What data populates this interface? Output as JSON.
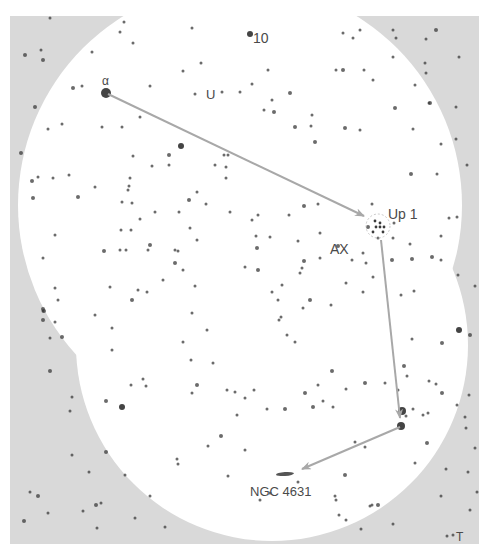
{
  "map": {
    "title": "Finder chart: Alpha to Up 1 to NGC 4631",
    "colors": {
      "page": "#ffffff",
      "sky_outside": "#d9d9d9",
      "sky_inside": "#ffffff",
      "star": "#3a3a3a",
      "arrow": "#a8a8a8",
      "label": "#4a4a4a"
    },
    "frame": {
      "x": 10,
      "y": 16,
      "width": 469,
      "height": 528
    },
    "fields_of_view": [
      {
        "cx": 240,
        "cy": 205,
        "r": 222
      },
      {
        "cx": 272,
        "cy": 345,
        "r": 196
      }
    ],
    "labels": [
      {
        "id": "alpha",
        "text": "α",
        "x": 102,
        "y": 85,
        "size": 12
      },
      {
        "id": "ten",
        "text": "10",
        "x": 253,
        "y": 43,
        "size": 14
      },
      {
        "id": "u",
        "text": "U",
        "x": 206,
        "y": 99,
        "size": 13
      },
      {
        "id": "up1",
        "text": "Up 1",
        "x": 388,
        "y": 219,
        "size": 14
      },
      {
        "id": "ax",
        "text": "AX",
        "x": 330,
        "y": 254,
        "size": 14
      },
      {
        "id": "ngc4631",
        "text": "NGC 4631",
        "x": 250,
        "y": 496,
        "size": 13
      },
      {
        "id": "t",
        "text": "T",
        "x": 456,
        "y": 541,
        "size": 12
      }
    ],
    "route": [
      {
        "from": "α",
        "to": "Up 1",
        "x1": 108,
        "y1": 94,
        "x2": 364,
        "y2": 216
      },
      {
        "from": "Up 1",
        "to": "star near 4631",
        "x1": 381,
        "y1": 240,
        "x2": 400,
        "y2": 418
      },
      {
        "from": "star near 4631",
        "to": "NGC 4631",
        "x1": 400,
        "y1": 427,
        "x2": 302,
        "y2": 469
      }
    ],
    "galaxy": {
      "name": "NGC 4631",
      "cx": 285,
      "cy": 474,
      "rx": 9,
      "ry": 2
    },
    "cluster": {
      "name": "Up 1",
      "cx": 378,
      "cy": 226,
      "r": 12
    },
    "stars": [
      [
        106,
        93,
        5
      ],
      [
        250,
        34,
        3
      ],
      [
        222,
        92,
        1.5
      ],
      [
        240,
        92,
        1.5
      ],
      [
        252,
        84,
        1.5
      ],
      [
        268,
        70,
        1.5
      ],
      [
        272,
        100,
        1.5
      ],
      [
        290,
        93,
        2
      ],
      [
        264,
        110,
        1.5
      ],
      [
        274,
        112,
        2
      ],
      [
        295,
        127,
        2
      ],
      [
        311,
        126,
        1.5
      ],
      [
        315,
        142,
        2
      ],
      [
        50,
        18,
        1.5
      ],
      [
        124,
        22,
        1.5
      ],
      [
        120,
        32,
        1.5
      ],
      [
        25,
        55,
        2
      ],
      [
        41,
        50,
        1.5
      ],
      [
        43,
        60,
        2
      ],
      [
        92,
        52,
        1.5
      ],
      [
        133,
        43,
        1.5
      ],
      [
        150,
        86,
        1.5
      ],
      [
        35,
        107,
        2
      ],
      [
        73,
        88,
        2
      ],
      [
        82,
        86,
        1.5
      ],
      [
        140,
        117,
        1.5
      ],
      [
        122,
        127,
        1.5
      ],
      [
        48,
        129,
        1.5
      ],
      [
        62,
        124,
        1.5
      ],
      [
        102,
        127,
        1.5
      ],
      [
        181,
        146,
        3
      ],
      [
        169,
        155,
        2
      ],
      [
        152,
        166,
        1.5
      ],
      [
        21,
        153,
        2
      ],
      [
        38,
        177,
        1.5
      ],
      [
        53,
        178,
        1.5
      ],
      [
        69,
        175,
        1.5
      ],
      [
        130,
        178,
        1.5
      ],
      [
        215,
        165,
        1.5
      ],
      [
        224,
        155,
        1.5
      ],
      [
        192,
        28,
        1.5
      ],
      [
        201,
        63,
        1.5
      ],
      [
        195,
        94,
        1.5
      ],
      [
        183,
        71,
        1.5
      ],
      [
        169,
        165,
        1.5
      ],
      [
        343,
        33,
        1.5
      ],
      [
        360,
        30,
        1.5
      ],
      [
        353,
        38,
        1.5
      ],
      [
        393,
        30,
        1.5
      ],
      [
        396,
        38,
        1.5
      ],
      [
        436,
        30,
        2
      ],
      [
        426,
        39,
        1.5
      ],
      [
        459,
        57,
        1.5
      ],
      [
        393,
        57,
        1.5
      ],
      [
        425,
        63,
        1.5
      ],
      [
        426,
        73,
        1.5
      ],
      [
        415,
        85,
        1.5
      ],
      [
        430,
        103,
        2
      ],
      [
        456,
        107,
        1.5
      ],
      [
        395,
        108,
        2
      ],
      [
        429,
        103,
        1.5
      ],
      [
        413,
        129,
        1.5
      ],
      [
        456,
        139,
        1.5
      ],
      [
        441,
        144,
        1.5
      ],
      [
        467,
        165,
        1.5
      ],
      [
        437,
        174,
        1.5
      ],
      [
        411,
        174,
        2
      ],
      [
        449,
        218,
        1.5
      ],
      [
        457,
        217,
        1.5
      ],
      [
        441,
        236,
        1.5
      ],
      [
        343,
        70,
        2
      ],
      [
        336,
        70,
        1.5
      ],
      [
        364,
        70,
        1.5
      ],
      [
        373,
        80,
        1.5
      ],
      [
        312,
        115,
        1.5
      ],
      [
        360,
        130,
        1.5
      ],
      [
        345,
        128,
        2
      ],
      [
        133,
        156,
        1.5
      ],
      [
        129,
        186,
        1.5
      ],
      [
        189,
        200,
        2
      ],
      [
        121,
        230,
        1.5
      ],
      [
        131,
        230,
        1.5
      ],
      [
        132,
        203,
        1.5
      ],
      [
        140,
        219,
        1.5
      ],
      [
        155,
        212,
        1.5
      ],
      [
        179,
        212,
        1.5
      ],
      [
        197,
        192,
        1.5
      ],
      [
        206,
        204,
        1.5
      ],
      [
        230,
        212,
        1.5
      ],
      [
        252,
        220,
        1.5
      ],
      [
        258,
        215,
        1.5
      ],
      [
        256,
        236,
        1.5
      ],
      [
        270,
        237,
        1.5
      ],
      [
        257,
        248,
        2
      ],
      [
        289,
        215,
        1.5
      ],
      [
        298,
        241,
        1.5
      ],
      [
        304,
        261,
        2
      ],
      [
        302,
        268,
        1.5
      ],
      [
        258,
        270,
        2
      ],
      [
        150,
        245,
        2
      ],
      [
        245,
        267,
        1.5
      ],
      [
        175,
        250,
        1.5
      ],
      [
        228,
        155,
        1.5
      ],
      [
        226,
        167,
        1.5
      ],
      [
        226,
        178,
        1.5
      ],
      [
        32,
        181,
        2
      ],
      [
        33,
        198,
        2
      ],
      [
        78,
        197,
        2
      ],
      [
        95,
        187,
        1.5
      ],
      [
        128,
        190,
        1.5
      ],
      [
        122,
        202,
        1.5
      ],
      [
        55,
        235,
        1.5
      ],
      [
        43,
        258,
        1.5
      ],
      [
        104,
        251,
        2
      ],
      [
        120,
        250,
        1.5
      ],
      [
        126,
        250,
        1.5
      ],
      [
        148,
        250,
        1.5
      ],
      [
        175,
        263,
        2
      ],
      [
        178,
        251,
        1.5
      ],
      [
        197,
        240,
        1.5
      ],
      [
        190,
        228,
        1.5
      ],
      [
        112,
        328,
        1.5
      ],
      [
        95,
        315,
        1.5
      ],
      [
        55,
        322,
        1.5
      ],
      [
        43,
        311,
        1.5
      ],
      [
        43,
        309,
        2
      ],
      [
        55,
        288,
        1.5
      ],
      [
        58,
        300,
        1.5
      ],
      [
        110,
        287,
        1.5
      ],
      [
        138,
        290,
        1.5
      ],
      [
        147,
        292,
        1.5
      ],
      [
        195,
        286,
        1.5
      ],
      [
        183,
        270,
        1.5
      ],
      [
        163,
        280,
        1.5
      ],
      [
        132,
        300,
        2
      ],
      [
        112,
        350,
        1.5
      ],
      [
        44,
        311,
        2
      ],
      [
        43,
        320,
        2
      ],
      [
        50,
        338,
        1.5
      ],
      [
        62,
        337,
        2
      ],
      [
        50,
        371,
        2
      ],
      [
        72,
        397,
        1.5
      ],
      [
        70,
        411,
        1.5
      ],
      [
        106,
        401,
        2
      ],
      [
        72,
        455,
        1.5
      ],
      [
        106,
        452,
        2
      ],
      [
        89,
        472,
        1.5
      ],
      [
        125,
        475,
        1.5
      ],
      [
        131,
        385,
        1.5
      ],
      [
        143,
        379,
        1.5
      ],
      [
        146,
        386,
        1.5
      ],
      [
        192,
        393,
        1.5
      ],
      [
        122,
        407,
        3
      ],
      [
        30,
        492,
        1.5
      ],
      [
        38,
        496,
        2
      ],
      [
        24,
        521,
        2
      ],
      [
        48,
        513,
        1.5
      ],
      [
        96,
        505,
        2
      ],
      [
        101,
        503,
        1.5
      ],
      [
        83,
        511,
        1.5
      ],
      [
        97,
        528,
        1.5
      ],
      [
        135,
        518,
        1.5
      ],
      [
        150,
        496,
        1.5
      ],
      [
        165,
        527,
        1.5
      ],
      [
        192,
        313,
        1.5
      ],
      [
        207,
        330,
        1.5
      ],
      [
        191,
        360,
        1.5
      ],
      [
        183,
        342,
        1.5
      ],
      [
        213,
        363,
        1.5
      ],
      [
        197,
        385,
        2
      ],
      [
        254,
        390,
        1.5
      ],
      [
        235,
        392,
        1.5
      ],
      [
        227,
        390,
        1.5
      ],
      [
        245,
        398,
        1.5
      ],
      [
        237,
        415,
        1.5
      ],
      [
        267,
        409,
        1.5
      ],
      [
        221,
        436,
        2
      ],
      [
        208,
        446,
        1.5
      ],
      [
        178,
        464,
        1.5
      ],
      [
        177,
        459,
        1.5
      ],
      [
        228,
        476,
        1.5
      ],
      [
        245,
        450,
        1.5
      ],
      [
        285,
        409,
        2
      ],
      [
        305,
        393,
        2
      ],
      [
        313,
        407,
        2
      ],
      [
        323,
        401,
        1.5
      ],
      [
        333,
        407,
        1.5
      ],
      [
        298,
        482,
        1.5
      ],
      [
        335,
        496,
        1.5
      ],
      [
        339,
        515,
        1.5
      ],
      [
        270,
        493,
        1.5
      ],
      [
        260,
        500,
        1.5
      ],
      [
        281,
        317,
        1.5
      ],
      [
        287,
        335,
        1.5
      ],
      [
        295,
        342,
        1.5
      ],
      [
        318,
        385,
        1.5
      ],
      [
        332,
        371,
        2
      ],
      [
        346,
        389,
        1.5
      ],
      [
        365,
        383,
        2
      ],
      [
        385,
        383,
        1.5
      ],
      [
        398,
        390,
        1.5
      ],
      [
        402,
        411,
        4
      ],
      [
        401,
        426,
        4
      ],
      [
        406,
        416,
        1.5
      ],
      [
        423,
        415,
        1.5
      ],
      [
        413,
        409,
        1.5
      ],
      [
        427,
        443,
        2
      ],
      [
        415,
        463,
        1.5
      ],
      [
        355,
        442,
        1.5
      ],
      [
        345,
        475,
        2
      ],
      [
        365,
        447,
        1.5
      ],
      [
        336,
        500,
        1.5
      ],
      [
        346,
        520,
        1.5
      ],
      [
        370,
        506,
        1.5
      ],
      [
        372,
        505,
        1.5
      ],
      [
        378,
        505,
        2
      ],
      [
        393,
        524,
        1.5
      ],
      [
        361,
        529,
        1.5
      ],
      [
        441,
        496,
        1.5
      ],
      [
        453,
        535,
        1.5
      ],
      [
        447,
        536,
        1.5
      ],
      [
        412,
        259,
        2
      ],
      [
        432,
        257,
        2
      ],
      [
        441,
        260,
        1.5
      ],
      [
        458,
        275,
        1.5
      ],
      [
        475,
        286,
        1.5
      ],
      [
        401,
        295,
        1.5
      ],
      [
        414,
        291,
        1.5
      ],
      [
        459,
        330,
        3
      ],
      [
        470,
        335,
        2
      ],
      [
        412,
        339,
        1.5
      ],
      [
        442,
        343,
        2
      ],
      [
        404,
        366,
        2
      ],
      [
        407,
        376,
        1.5
      ],
      [
        429,
        381,
        1.5
      ],
      [
        436,
        384,
        1.5
      ],
      [
        442,
        393,
        2
      ],
      [
        457,
        405,
        1.5
      ],
      [
        428,
        413,
        1.5
      ],
      [
        466,
        428,
        1.5
      ],
      [
        469,
        395,
        1.5
      ],
      [
        465,
        417,
        1.5
      ],
      [
        475,
        448,
        1.5
      ],
      [
        468,
        472,
        1.5
      ],
      [
        477,
        492,
        1.5
      ],
      [
        470,
        510,
        1.5
      ],
      [
        446,
        469,
        1.5
      ],
      [
        304,
        206,
        2
      ],
      [
        394,
        223,
        1.5
      ],
      [
        368,
        227,
        2
      ],
      [
        372,
        204,
        1.5
      ],
      [
        378,
        238,
        1.5
      ],
      [
        318,
        204,
        1.5
      ],
      [
        320,
        233,
        1.5
      ],
      [
        338,
        246,
        2
      ],
      [
        352,
        260,
        1.5
      ],
      [
        363,
        253,
        1.5
      ],
      [
        346,
        283,
        1.5
      ],
      [
        363,
        292,
        1.5
      ],
      [
        331,
        305,
        1.5
      ],
      [
        310,
        300,
        2
      ],
      [
        303,
        308,
        1.5
      ],
      [
        279,
        320,
        1.5
      ],
      [
        278,
        300,
        1.5
      ],
      [
        272,
        292,
        1.5
      ],
      [
        282,
        285,
        1.5
      ],
      [
        300,
        273,
        1.5
      ],
      [
        320,
        258,
        1.5
      ],
      [
        366,
        263,
        1.5
      ],
      [
        373,
        277,
        1.5
      ],
      [
        393,
        238,
        1.5
      ],
      [
        392,
        260,
        2
      ],
      [
        410,
        244,
        1.5
      ]
    ]
  }
}
